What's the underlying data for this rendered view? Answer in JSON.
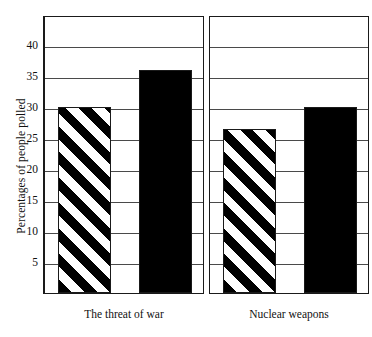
{
  "chart_data": {
    "type": "bar",
    "title": "",
    "xlabel": "",
    "ylabel": "Percentages of people polled",
    "ylim": [
      0,
      44
    ],
    "yticks": [
      5,
      10,
      15,
      20,
      25,
      30,
      35,
      40
    ],
    "grid": true,
    "legend": "none",
    "categories": [
      "The threat of war",
      "Nuclear weapons"
    ],
    "series": [
      {
        "name": "striped",
        "fill": "diagonal-stripes",
        "values": [
          30,
          26.5
        ]
      },
      {
        "name": "black",
        "fill": "solid-black",
        "values": [
          36,
          30
        ]
      }
    ],
    "panels": [
      {
        "label": "The threat of war",
        "bars": [
          {
            "fill": "striped",
            "value": 30
          },
          {
            "fill": "solid",
            "value": 36
          }
        ]
      },
      {
        "label": "Nuclear weapons",
        "bars": [
          {
            "fill": "striped",
            "value": 26.5
          },
          {
            "fill": "solid",
            "value": 30
          }
        ]
      }
    ]
  },
  "axis": {
    "y_title": "Percentages of people polled",
    "tick_labels": [
      "40",
      "35",
      "30",
      "25",
      "20",
      "15",
      "10",
      "5"
    ]
  },
  "colors": {
    "ink": "#1a1a1a",
    "grid": "#4a4a4a",
    "bar_solid": "#000000",
    "background": "#ffffff"
  }
}
